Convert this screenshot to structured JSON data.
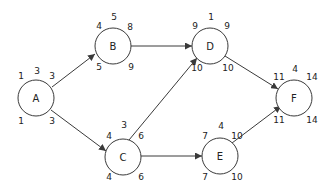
{
  "diagram": {
    "type": "activity-on-node network (critical path)",
    "colors": {
      "stroke": "#3a3a3a",
      "text": "#222222",
      "background": "#ffffff"
    },
    "nodes": [
      {
        "id": "A",
        "label": "A",
        "duration": "3",
        "es": "1",
        "ef": "3",
        "ls": "1",
        "lf": "3"
      },
      {
        "id": "B",
        "label": "B",
        "duration": "5",
        "es": "4",
        "ef": "8",
        "ls": "5",
        "lf": "9"
      },
      {
        "id": "C",
        "label": "C",
        "duration": "3",
        "es": "4",
        "ef": "6",
        "ls": "4",
        "lf": "6"
      },
      {
        "id": "D",
        "label": "D",
        "duration": "1",
        "es": "9",
        "ef": "9",
        "ls": "10",
        "lf": "10"
      },
      {
        "id": "E",
        "label": "E",
        "duration": "4",
        "es": "7",
        "ef": "10",
        "ls": "7",
        "lf": "10"
      },
      {
        "id": "F",
        "label": "F",
        "duration": "4",
        "es": "11",
        "ef": "14",
        "ls": "11",
        "lf": "14"
      }
    ],
    "edges": [
      {
        "from": "A",
        "to": "B"
      },
      {
        "from": "A",
        "to": "C"
      },
      {
        "from": "B",
        "to": "D"
      },
      {
        "from": "C",
        "to": "D"
      },
      {
        "from": "C",
        "to": "E"
      },
      {
        "from": "D",
        "to": "F"
      },
      {
        "from": "E",
        "to": "F"
      }
    ]
  }
}
